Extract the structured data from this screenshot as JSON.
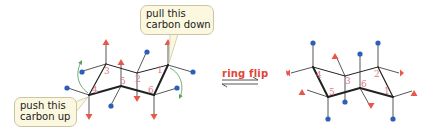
{
  "diagram": {
    "colors": {
      "bond": "#222222",
      "axial_up_marker": "#e8574a",
      "equatorial_marker": "#2e5fb8",
      "number_label": "#e07a86",
      "callout_bg": "#fbf8df",
      "curved_arrow": "#5aa45a",
      "arrow_label": "#e0453a"
    },
    "callouts": {
      "pull": {
        "line1": "pull this",
        "line2": "carbon down"
      },
      "push": {
        "line1": "push this",
        "line2": "carbon up"
      }
    },
    "arrow": {
      "label": "ring flip",
      "type": "equilibrium"
    },
    "left_chair": {
      "carbons": [
        {
          "label": "1",
          "x": 168,
          "y": 65
        },
        {
          "label": "2",
          "x": 137,
          "y": 73
        },
        {
          "label": "3",
          "x": 106,
          "y": 64
        },
        {
          "label": "4",
          "x": 89,
          "y": 95
        },
        {
          "label": "5",
          "x": 121,
          "y": 86
        },
        {
          "label": "6",
          "x": 154,
          "y": 95
        }
      ],
      "substituents": {
        "red_triangles": "axial up at C1, C3, C5; axial down at C2, C4, C6",
        "blue_dots": "equatorial at all six carbons"
      }
    },
    "right_chair": {
      "carbons": [
        {
          "label": "1",
          "x": 393,
          "y": 97
        },
        {
          "label": "2",
          "x": 378,
          "y": 67
        },
        {
          "label": "3",
          "x": 345,
          "y": 76
        },
        {
          "label": "4",
          "x": 313,
          "y": 67
        },
        {
          "label": "5",
          "x": 328,
          "y": 97
        },
        {
          "label": "6",
          "x": 360,
          "y": 88
        }
      ],
      "substituents": {
        "red_triangles": "equatorial at all six carbons",
        "blue_dots": "axial at all six carbons"
      }
    }
  }
}
